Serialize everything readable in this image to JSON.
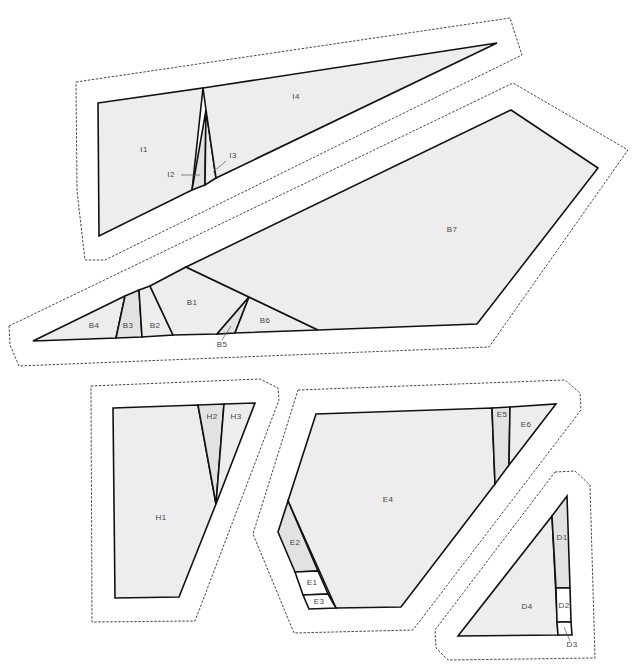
{
  "colors": {
    "light": "#ededed",
    "medium": "#e2e2e2",
    "white": "#ffffff",
    "line": "#111111",
    "outline": "#333333"
  },
  "sections": [
    {
      "id": "I",
      "outline": "76,82 510,18 522,55 105,260 85,260 77,191",
      "pieces": [
        {
          "label": "I1",
          "points": "98,103 203,88 192,190 99,236",
          "fill": "light",
          "lx": 144,
          "ly": 150
        },
        {
          "label": "I2",
          "points": "206,110 192,190 205,185",
          "fill": "medium",
          "lx": 171,
          "ly": 175,
          "leader": "181,175 200,175"
        },
        {
          "label": "I3",
          "points": "206,110 205,185 216,178",
          "fill": "light",
          "lx": 233,
          "ly": 156,
          "leader": "226,161 213,172"
        },
        {
          "label": "I4",
          "points": "203,88 497,43 216,178 206,110",
          "fill": "light",
          "lx": 296,
          "ly": 97
        }
      ]
    },
    {
      "id": "B",
      "outline": "9,326 513,83 628,150 489,347 19,366 10,345",
      "pieces": [
        {
          "label": "B4",
          "points": "33,341 125,296 116,338",
          "fill": "light",
          "lx": 94,
          "ly": 326
        },
        {
          "label": "B3",
          "points": "125,296 139,290 142,337 116,338",
          "fill": "medium",
          "lx": 128,
          "ly": 326
        },
        {
          "label": "B2",
          "points": "139,290 150,286 173,335 142,337",
          "fill": "light",
          "lx": 155,
          "ly": 326
        },
        {
          "label": "B1",
          "points": "150,286 186,267 249,297 217,334 173,335",
          "fill": "light",
          "lx": 192,
          "ly": 303
        },
        {
          "label": "B5",
          "points": "249,297 217,334 235,333",
          "fill": "medium",
          "lx": 222,
          "ly": 345,
          "leader": "222,340 231,326"
        },
        {
          "label": "B6",
          "points": "249,297 318,330 235,333",
          "fill": "light",
          "lx": 265,
          "ly": 321
        },
        {
          "label": "B7",
          "points": "186,267 511,110 598,168 477,324 318,330 249,297",
          "fill": "light",
          "lx": 452,
          "ly": 230
        }
      ]
    },
    {
      "id": "H",
      "outline": "91,386 260,379 278,388 279,400 195,621 92,622",
      "pieces": [
        {
          "label": "H1",
          "points": "113,408 198,405 216,504 179,597 115,598",
          "fill": "light",
          "lx": 161,
          "ly": 518
        },
        {
          "label": "H2",
          "points": "198,405 224,404 216,504",
          "fill": "medium",
          "lx": 212,
          "ly": 417
        },
        {
          "label": "H3",
          "points": "224,404 255,403 216,504",
          "fill": "light",
          "lx": 236,
          "ly": 417
        }
      ]
    },
    {
      "id": "E",
      "outline": "298,390 565,380 580,393 581,410 413,630 294,633 253,534",
      "pieces": [
        {
          "label": "E4",
          "points": "316,414 492,408 495,484 401,607 336,608 288,501",
          "fill": "light",
          "lx": 388,
          "ly": 500
        },
        {
          "label": "E2",
          "points": "288,501 278,532 295,572 318,571",
          "fill": "medium",
          "lx": 295,
          "ly": 543
        },
        {
          "label": "E1",
          "points": "295,572 318,571 328,594 303,595",
          "fill": "white",
          "lx": 312,
          "ly": 583
        },
        {
          "label": "E3",
          "points": "303,595 328,594 336,608 309,609",
          "fill": "white",
          "lx": 319,
          "ly": 602
        },
        {
          "label": "E5",
          "points": "492,408 510,407 509,465 495,484",
          "fill": "medium",
          "lx": 502,
          "ly": 415
        },
        {
          "label": "E6",
          "points": "510,407 556,404 509,465",
          "fill": "light",
          "lx": 526,
          "ly": 425
        }
      ]
    },
    {
      "id": "D",
      "outline": "555,472 575,471 590,485 595,658 448,660 436,648 435,630",
      "pieces": [
        {
          "label": "D4",
          "points": "552,516 558,635 458,636",
          "fill": "light",
          "lx": 527,
          "ly": 607
        },
        {
          "label": "D1",
          "points": "552,516 567,496 570,588 556,588",
          "fill": "medium",
          "lx": 562,
          "ly": 538
        },
        {
          "label": "D2",
          "points": "556,588 570,588 571,622 557,622",
          "fill": "white",
          "lx": 564,
          "ly": 606
        },
        {
          "label": "D3",
          "points": "557,622 571,622 572,635 558,635",
          "fill": "white",
          "lx": 572,
          "ly": 645,
          "leader": "570,641 564,627"
        }
      ]
    }
  ]
}
